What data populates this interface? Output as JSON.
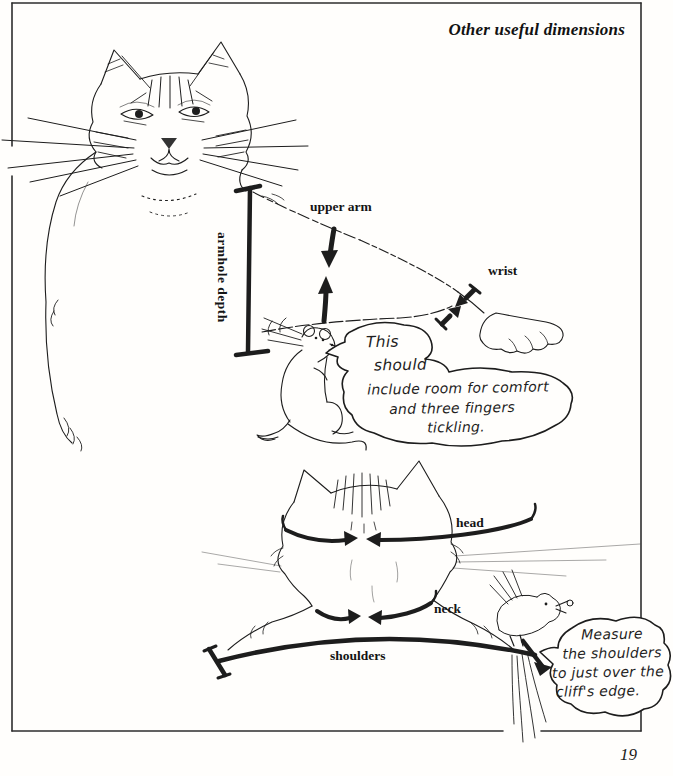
{
  "page": {
    "title": "Other useful dimensions",
    "page_number": "19"
  },
  "measurement_labels": {
    "armhole_depth": "armhole depth",
    "upper_arm": "upper arm",
    "wrist": "wrist",
    "head": "head",
    "neck": "neck",
    "shoulders": "shoulders"
  },
  "speech_bubbles": {
    "mouse": {
      "lines": [
        "This",
        "should",
        "include room for comfort",
        "and three fingers",
        "tickling."
      ]
    },
    "bird": {
      "lines": [
        "Measure",
        "the shoulders",
        "to just over the",
        "cliff's edge."
      ]
    }
  },
  "illustrations": {
    "cat_front": "cat front portrait",
    "mouse": "standing mouse",
    "cat_back": "cat head and shoulders from behind",
    "bird": "perched bird holding morsel"
  },
  "colors": {
    "ink": "#1d1d1d",
    "paper": "#fffefc",
    "border": "#2e2e2e"
  }
}
